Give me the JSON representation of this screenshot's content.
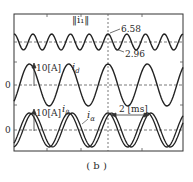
{
  "chart_data": {
    "type": "line",
    "caption": "(b)",
    "time_scale": "2 [ms] between peaks (arrow)",
    "panels": [
      {
        "name": "current-norm",
        "label": "||i1||",
        "annotations": {
          "max": "6.58",
          "min": "2.96"
        },
        "series": [
          {
            "name": "||i1||",
            "max": 6.58,
            "min": 2.96,
            "cycles": 9
          }
        ]
      },
      {
        "name": "d-axis-current",
        "label": "i_d",
        "scale": "10[A]",
        "zero_label": "0",
        "series": [
          {
            "name": "i_d",
            "amplitude_A": 10,
            "cycles": 4.3
          }
        ]
      },
      {
        "name": "alpha-beta-currents",
        "labels": [
          "i_beta",
          "i_alpha"
        ],
        "scale": "10[A]",
        "zero_label": "0",
        "series": [
          {
            "name": "i_beta",
            "amplitude_A": 9,
            "cycles": 4.3
          },
          {
            "name": "i_alpha",
            "amplitude_A": 9,
            "cycles": 4.3,
            "phase_lag": "slight"
          }
        ]
      }
    ],
    "grid": false,
    "legend": "inline labels"
  },
  "labels": {
    "norm": "‖i₁‖",
    "max_value": "6.58",
    "min_value": "2.96",
    "scale_mid": "10[A]",
    "id_label": "i",
    "id_sub": "d",
    "zero_mid": "0",
    "scale_bot": "10[A]",
    "ibeta_label": "i",
    "ibeta_sub": "β",
    "ialpha_label": "i",
    "ialpha_sub": "α",
    "zero_bot": "0",
    "time_span": "2 [ms]",
    "caption": "( b )"
  }
}
